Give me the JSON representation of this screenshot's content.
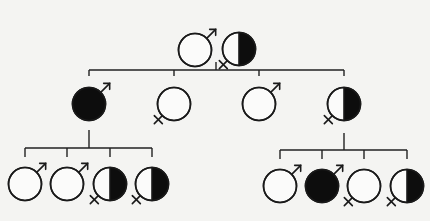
{
  "diagram": {
    "type": "pedigree",
    "colors": {
      "affected": "#0d0d0d",
      "unaffected": "#fbfbfa",
      "line": "#222222"
    },
    "legend_states": [
      "unaffected",
      "carrier (half filled)",
      "affected (filled)"
    ],
    "generations": [
      {
        "id": "I",
        "members": [
          {
            "id": "I-1",
            "sex": "male",
            "status": "unaffected",
            "cx": 195,
            "cy": 50
          },
          {
            "id": "I-2",
            "sex": "female",
            "status": "carrier",
            "cx": 239,
            "cy": 49
          }
        ]
      },
      {
        "id": "II",
        "members": [
          {
            "id": "II-1",
            "sex": "male",
            "status": "affected",
            "cx": 89,
            "cy": 104
          },
          {
            "id": "II-2",
            "sex": "female",
            "status": "unaffected",
            "cx": 174,
            "cy": 104
          },
          {
            "id": "II-3",
            "sex": "male",
            "status": "unaffected",
            "cx": 259,
            "cy": 104
          },
          {
            "id": "II-4",
            "sex": "female",
            "status": "carrier",
            "cx": 344,
            "cy": 104
          }
        ]
      },
      {
        "id": "III",
        "members": [
          {
            "id": "III-1",
            "sex": "male",
            "status": "unaffected",
            "cx": 25,
            "cy": 184,
            "parent": "II-1"
          },
          {
            "id": "III-2",
            "sex": "male",
            "status": "unaffected",
            "cx": 67,
            "cy": 184,
            "parent": "II-1"
          },
          {
            "id": "III-3",
            "sex": "female",
            "status": "carrier",
            "cx": 110,
            "cy": 184,
            "parent": "II-1"
          },
          {
            "id": "III-4",
            "sex": "female",
            "status": "carrier",
            "cx": 152,
            "cy": 184,
            "parent": "II-1"
          },
          {
            "id": "III-5",
            "sex": "male",
            "status": "unaffected",
            "cx": 280,
            "cy": 186,
            "parent": "II-4"
          },
          {
            "id": "III-6",
            "sex": "male",
            "status": "affected",
            "cx": 322,
            "cy": 186,
            "parent": "II-4"
          },
          {
            "id": "III-7",
            "sex": "female",
            "status": "unaffected",
            "cx": 364,
            "cy": 186,
            "parent": "II-4"
          },
          {
            "id": "III-8",
            "sex": "female",
            "status": "carrier",
            "cx": 407,
            "cy": 186,
            "parent": "II-4"
          }
        ]
      }
    ],
    "connectors": [
      {
        "from": "I",
        "drop": [
          216,
          62,
          70
        ],
        "bar": [
          89,
          344,
          70
        ],
        "ticks": [
          89,
          174,
          259,
          344
        ],
        "tick_bottom": 76
      },
      {
        "from": "II-1",
        "drop": [
          89,
          130,
          148
        ],
        "bar": [
          25,
          152,
          148
        ],
        "ticks": [
          25,
          67,
          110,
          152
        ],
        "tick_bottom": 157
      },
      {
        "from": "II-4",
        "drop": [
          344,
          133,
          150
        ],
        "bar": [
          280,
          407,
          150
        ],
        "ticks": [
          280,
          322,
          364,
          407
        ],
        "tick_bottom": 159
      }
    ]
  }
}
